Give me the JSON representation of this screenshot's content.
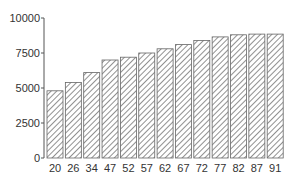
{
  "chart_data": {
    "type": "bar",
    "title": "",
    "xlabel": "",
    "ylabel": "",
    "categories": [
      "20",
      "26",
      "34",
      "47",
      "52",
      "57",
      "62",
      "67",
      "72",
      "77",
      "82",
      "87",
      "91"
    ],
    "values": [
      4800,
      5400,
      6100,
      7000,
      7200,
      7500,
      7800,
      8100,
      8400,
      8650,
      8800,
      8850,
      8850
    ],
    "ylim": [
      0,
      10000
    ],
    "yticks": [
      0,
      2500,
      5000,
      7500,
      10000
    ],
    "ytick_labels": [
      "0",
      "2500",
      "5000",
      "7500",
      "10000"
    ],
    "grid": false,
    "legend": null,
    "bar_style": {
      "fill": "hatched",
      "hatch_color": "#555555",
      "edge_color": "#666666",
      "background": "#ffffff"
    }
  }
}
